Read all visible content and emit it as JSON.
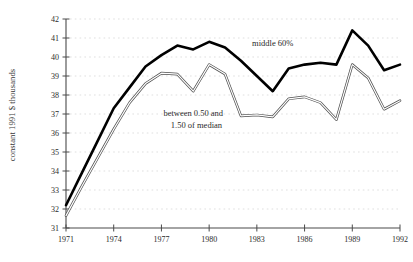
{
  "chart_data": {
    "type": "line",
    "title": "",
    "xlabel": "",
    "ylabel": "constant 1991 $ thousands",
    "xlim": [
      1971,
      1992
    ],
    "ylim": [
      31,
      42
    ],
    "grid": true,
    "legend": "inline-annotations",
    "x": [
      1971,
      1972,
      1973,
      1974,
      1975,
      1976,
      1977,
      1978,
      1979,
      1980,
      1981,
      1982,
      1983,
      1984,
      1985,
      1986,
      1987,
      1988,
      1989,
      1990,
      1991,
      1992
    ],
    "xticks": [
      1971,
      1974,
      1977,
      1980,
      1983,
      1986,
      1989,
      1992
    ],
    "yticks": [
      31,
      32,
      33,
      34,
      35,
      36,
      37,
      38,
      39,
      40,
      41,
      42
    ],
    "series": [
      {
        "name": "middle 60%",
        "style": "thick-black",
        "color": "#000000",
        "values": [
          32.2,
          33.9,
          35.6,
          37.3,
          38.4,
          39.5,
          40.1,
          40.6,
          40.4,
          40.8,
          40.5,
          39.8,
          39.0,
          38.2,
          39.4,
          39.6,
          39.7,
          39.6,
          41.4,
          40.6,
          39.3,
          39.6
        ]
      },
      {
        "name": "between 0.50 and 1.50 of median",
        "style": "thin-double",
        "color": "#4f4f4f",
        "values": [
          31.65,
          33.2,
          34.7,
          36.2,
          37.6,
          38.6,
          39.15,
          39.1,
          38.2,
          39.6,
          39.1,
          36.9,
          36.95,
          36.85,
          37.8,
          37.9,
          37.6,
          36.7,
          39.6,
          38.9,
          37.25,
          37.7
        ]
      }
    ],
    "annotations": [
      {
        "text": "middle 60%",
        "x": 1984.0,
        "y": 40.6
      },
      {
        "text": "between 0.50 and",
        "x": 1979.0,
        "y": 36.9
      },
      {
        "text": "1.50 of median",
        "x": 1979.2,
        "y": 36.25
      }
    ]
  }
}
